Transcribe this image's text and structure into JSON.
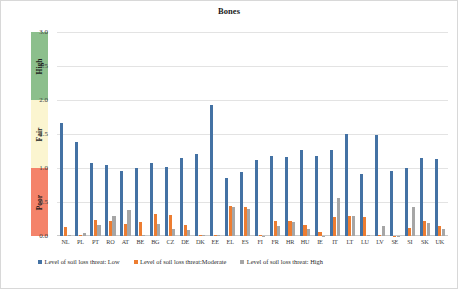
{
  "chart_data": {
    "type": "bar",
    "title": "Bones",
    "xlabel": "",
    "ylabel": "Status of preservation",
    "ylim": [
      0,
      3.0
    ],
    "grid": true,
    "legend_position": "bottom",
    "y_ticks": [
      "0.0",
      "0.5",
      "1.0",
      "1.5",
      "2.0",
      "2.5",
      "3.0"
    ],
    "y_tick_values": [
      0.0,
      0.5,
      1.0,
      1.5,
      2.0,
      2.5,
      3.0
    ],
    "categories": [
      "NL",
      "PL",
      "PT",
      "RO",
      "AT",
      "BE",
      "BG",
      "CZ",
      "DE",
      "DK",
      "EE",
      "EL",
      "ES",
      "FI",
      "FR",
      "HR",
      "HU",
      "IE",
      "IT",
      "LT",
      "LU",
      "LV",
      "SE",
      "SI",
      "SK",
      "UK"
    ],
    "series": [
      {
        "name": "Level of soil loss threat: Low",
        "color": "#4472a4",
        "values": [
          1.66,
          1.38,
          1.08,
          1.05,
          0.95,
          1.0,
          1.08,
          1.01,
          1.14,
          1.2,
          1.93,
          0.86,
          0.94,
          1.12,
          1.17,
          1.16,
          1.27,
          1.17,
          1.27,
          1.5,
          0.91,
          1.48,
          0.96,
          1.0,
          1.14,
          1.13
        ]
      },
      {
        "name": "Level of soil loss threat:Moderate",
        "color": "#ed7d31",
        "values": [
          0.13,
          0.02,
          0.24,
          0.22,
          0.17,
          0.21,
          0.32,
          0.31,
          0.16,
          0.01,
          0.01,
          0.44,
          0.42,
          0.01,
          0.22,
          0.22,
          0.16,
          0.06,
          0.28,
          0.3,
          0.28,
          0.01,
          0.0,
          0.12,
          0.22,
          0.14
        ]
      },
      {
        "name": "Level of soil loss threat: High",
        "color": "#a6a6a6",
        "values": [
          0.01,
          0.05,
          0.16,
          0.3,
          0.38,
          0.01,
          0.17,
          0.11,
          0.09,
          0.02,
          0.01,
          0.43,
          0.39,
          0.0,
          0.14,
          0.21,
          0.1,
          0.0,
          0.56,
          0.3,
          0.02,
          0.14,
          0.0,
          0.42,
          0.19,
          0.1
        ]
      }
    ]
  },
  "status_bands": [
    {
      "label": "High",
      "color": "#8cbf8c",
      "range": [
        2.0,
        3.0
      ]
    },
    {
      "label": "Fair",
      "color": "#fbf5d0",
      "range": [
        1.0,
        2.0
      ]
    },
    {
      "label": "Poor",
      "color": "#f4836a",
      "range": [
        0.0,
        1.0
      ]
    }
  ]
}
